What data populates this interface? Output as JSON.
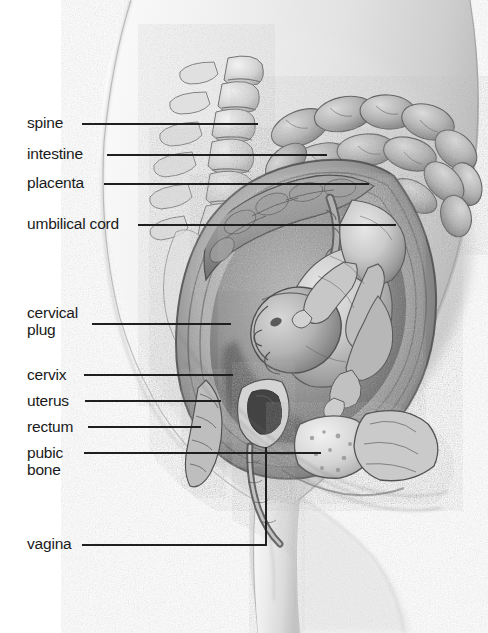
{
  "figure": {
    "style": "grayscale pencil medical illustration",
    "background_color": "#ffffff",
    "leader_color": "#1f1f1f",
    "text_color": "#1a1a1a"
  },
  "labels": [
    {
      "id": "spine",
      "text": "spine",
      "lines": [
        "spine"
      ],
      "x": 27,
      "y": 114,
      "leader": {
        "type": "line",
        "x1": 82,
        "y1": 124,
        "x2": 258,
        "y2": 124
      }
    },
    {
      "id": "intestine",
      "text": "intestine",
      "lines": [
        "intestine"
      ],
      "x": 27,
      "y": 145,
      "leader": {
        "type": "line",
        "x1": 107,
        "y1": 155,
        "x2": 327,
        "y2": 155
      }
    },
    {
      "id": "placenta",
      "text": "placenta",
      "lines": [
        "placenta"
      ],
      "x": 27,
      "y": 174,
      "leader": {
        "type": "line",
        "x1": 104,
        "y1": 184,
        "x2": 369,
        "y2": 184
      }
    },
    {
      "id": "umbilical-cord",
      "text": "umbilical cord",
      "lines": [
        "umbilical cord"
      ],
      "x": 27,
      "y": 215,
      "leader": {
        "type": "line",
        "x1": 138,
        "y1": 225,
        "x2": 396,
        "y2": 225
      }
    },
    {
      "id": "cervical-plug",
      "text": "cervical plug",
      "lines": [
        "cervical",
        "plug"
      ],
      "x": 27,
      "y": 304,
      "leader": {
        "type": "line",
        "x1": 92,
        "y1": 324,
        "x2": 231,
        "y2": 324
      }
    },
    {
      "id": "cervix",
      "text": "cervix",
      "lines": [
        "cervix"
      ],
      "x": 27,
      "y": 366,
      "leader": {
        "type": "line",
        "x1": 84,
        "y1": 375,
        "x2": 233,
        "y2": 375
      }
    },
    {
      "id": "uterus",
      "text": "uterus",
      "lines": [
        "uterus"
      ],
      "x": 27,
      "y": 392,
      "leader": {
        "type": "line",
        "x1": 85,
        "y1": 401,
        "x2": 221,
        "y2": 401
      }
    },
    {
      "id": "rectum",
      "text": "rectum",
      "lines": [
        "rectum"
      ],
      "x": 27,
      "y": 418,
      "leader": {
        "type": "line",
        "x1": 88,
        "y1": 427,
        "x2": 201,
        "y2": 427
      }
    },
    {
      "id": "pubic-bone",
      "text": "pubic bone",
      "lines": [
        "pubic",
        "bone"
      ],
      "x": 27,
      "y": 444,
      "leader": {
        "type": "line",
        "x1": 84,
        "y1": 453,
        "x2": 321,
        "y2": 453
      }
    },
    {
      "id": "vagina",
      "text": "vagina",
      "lines": [
        "vagina"
      ],
      "x": 27,
      "y": 535,
      "leader": {
        "type": "elbow",
        "x1": 82,
        "y1": 545,
        "x2": 266,
        "y2": 545,
        "x3": 266,
        "y3": 447
      }
    }
  ],
  "anatomy_parts": [
    "maternal torso silhouette",
    "lumbar vertebrae and sacrum",
    "intestines",
    "placenta",
    "umbilical cord",
    "fetus in cephalic (head-down) presentation",
    "uterine wall and amniotic sac",
    "cervical mucus plug",
    "cervix",
    "rectum",
    "pubic bone",
    "bladder",
    "vagina"
  ]
}
